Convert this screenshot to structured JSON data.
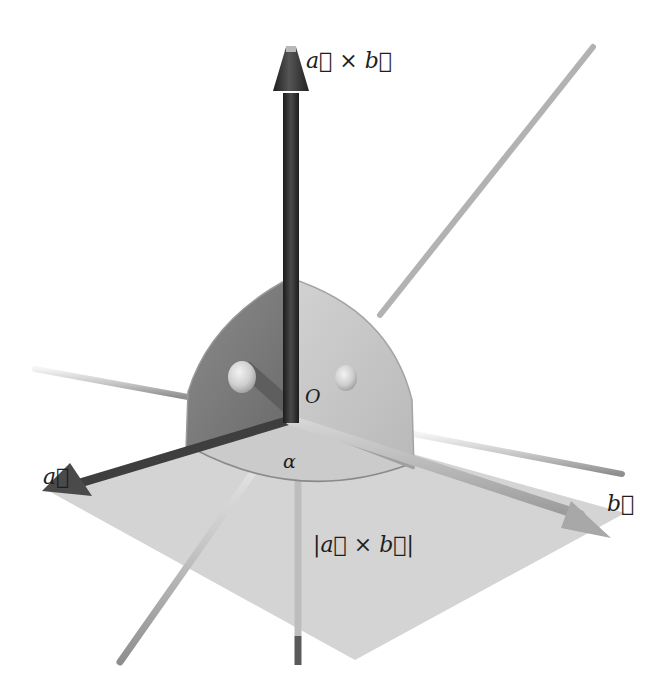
{
  "diagram": {
    "type": "3d-vector-cross-product",
    "labels": {
      "cross_product": "a⃗ × b⃗",
      "vector_a": "a⃗",
      "vector_b": "b⃗",
      "origin": "O",
      "angle": "α",
      "area": "|a⃗ × b⃗|"
    },
    "colors": {
      "background": "#ffffff",
      "cross_product_vector": "#2e2e2e",
      "vector_a": "#4a4a4a",
      "vector_b": "#a8a8a8",
      "parallelogram": "#d4d4d4",
      "quarter_disc_dark": "#7a7a7a",
      "quarter_disc_light": "#c6c6c6",
      "axis_rod": "#bcbcbc",
      "label_text": "#1e1e1e"
    },
    "elements": [
      "cross-product-vector",
      "vector-a",
      "vector-b",
      "parallelogram-area",
      "angle-arc",
      "quarter-disc-left",
      "quarter-disc-right",
      "coordinate-axis-rods"
    ]
  }
}
